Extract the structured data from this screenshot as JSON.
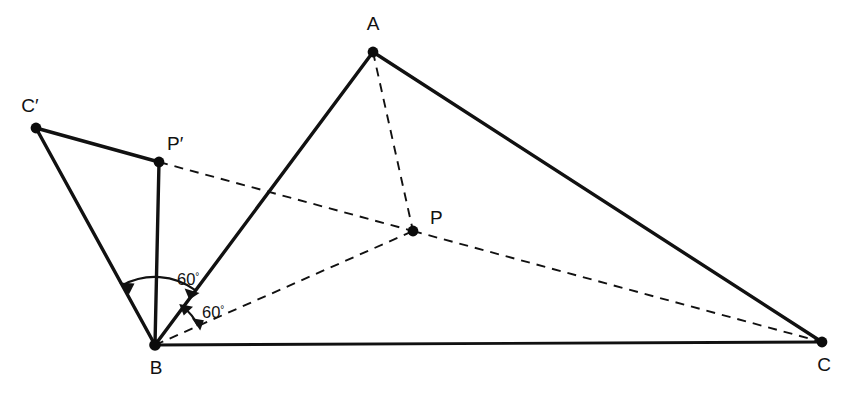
{
  "figure": {
    "background_color": "#ffffff",
    "line_color": "#111111",
    "width": 856,
    "height": 393
  },
  "points": [
    {
      "id": "A",
      "label": "A",
      "x": 373,
      "y": 52,
      "label_x": 373,
      "label_y": 30,
      "anchor": "middle"
    },
    {
      "id": "B",
      "label": "B",
      "x": 155,
      "y": 345,
      "label_x": 156,
      "label_y": 374,
      "anchor": "middle"
    },
    {
      "id": "C",
      "label": "C",
      "x": 822,
      "y": 342,
      "label_x": 824,
      "label_y": 371,
      "anchor": "middle"
    },
    {
      "id": "P",
      "label": "P",
      "x": 413,
      "y": 231,
      "label_x": 430,
      "label_y": 224,
      "anchor": "start"
    },
    {
      "id": "Pp",
      "label": "P′",
      "x": 159,
      "y": 162,
      "label_x": 167,
      "label_y": 150,
      "anchor": "start"
    },
    {
      "id": "Cp",
      "label": "C′",
      "x": 36,
      "y": 128,
      "label_x": 30,
      "label_y": 112,
      "anchor": "middle"
    }
  ],
  "solid_edges": [
    {
      "id": "B-A",
      "from": "B",
      "to": "A",
      "style": "solid"
    },
    {
      "id": "A-C",
      "from": "A",
      "to": "C",
      "style": "solid"
    },
    {
      "id": "B-C",
      "from": "B",
      "to": "C",
      "style": "solid"
    },
    {
      "id": "Cp-Pp",
      "from": "C′",
      "to": "P′",
      "style": "solid"
    },
    {
      "id": "Cp-B",
      "from": "C′",
      "to": "B",
      "style": "solid"
    },
    {
      "id": "Pp-B",
      "from": "P′",
      "to": "B",
      "style": "solid"
    }
  ],
  "dashed_edges": [
    {
      "id": "A-P",
      "from": "A",
      "to": "P",
      "style": "dashed"
    },
    {
      "id": "B-P",
      "from": "B",
      "to": "P",
      "style": "dashed"
    },
    {
      "id": "P-C",
      "from": "P",
      "to": "C",
      "style": "dashed"
    },
    {
      "id": "Pp-P",
      "from": "P′",
      "to": "P",
      "style": "dashed"
    }
  ],
  "angles": [
    {
      "id": "angle-C-prime-B-A",
      "value": "60",
      "degree_symbol": "°",
      "vertex": "B",
      "between": [
        "C′",
        "A"
      ],
      "label_x": 177,
      "label_y": 285,
      "radius": 68
    },
    {
      "id": "angle-A-B-P",
      "value": "60",
      "degree_symbol": "°",
      "vertex": "B",
      "between": [
        "A",
        "P"
      ],
      "label_x": 202,
      "label_y": 318,
      "radius": 47
    }
  ]
}
